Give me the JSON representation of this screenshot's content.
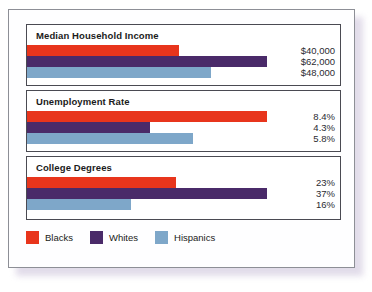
{
  "chart_data": {
    "type": "bar",
    "orientation": "horizontal",
    "title": "",
    "xlabel": "",
    "ylabel": "",
    "grid": false,
    "legend_position": "bottom-left",
    "categories": [
      "Median Household Income",
      "Unemployment Rate",
      "College Degrees"
    ],
    "series": [
      {
        "name": "Blacks",
        "color": "#e8351c",
        "values": [
          40000,
          8.4,
          23
        ]
      },
      {
        "name": "Whites",
        "color": "#4a2a69",
        "values": [
          62000,
          4.3,
          37
        ]
      },
      {
        "name": "Hispanics",
        "color": "#7ea7c9",
        "values": [
          48000,
          5.8,
          16
        ]
      }
    ],
    "groups": [
      {
        "title": "Median Household Income",
        "bars": [
          {
            "series": "Blacks",
            "value": 40000,
            "label": "$40,000",
            "bar_pct": 63.5
          },
          {
            "series": "Whites",
            "value": 62000,
            "label": "$62,000",
            "bar_pct": 100.0
          },
          {
            "series": "Hispanics",
            "value": 48000,
            "label": "$48,000",
            "bar_pct": 76.5
          }
        ]
      },
      {
        "title": "Unemployment Rate",
        "bars": [
          {
            "series": "Blacks",
            "value": 8.4,
            "label": "8.4%",
            "bar_pct": 100.0
          },
          {
            "series": "Whites",
            "value": 4.3,
            "label": "4.3%",
            "bar_pct": 51.2
          },
          {
            "series": "Hispanics",
            "value": 5.8,
            "label": "5.8%",
            "bar_pct": 69.0
          }
        ]
      },
      {
        "title": "College Degrees",
        "bars": [
          {
            "series": "Blacks",
            "value": 23,
            "label": "23%",
            "bar_pct": 62.2
          },
          {
            "series": "Whites",
            "value": 37,
            "label": "37%",
            "bar_pct": 100.0
          },
          {
            "series": "Hispanics",
            "value": 16,
            "label": "16%",
            "bar_pct": 43.2
          }
        ]
      }
    ],
    "legend": [
      {
        "label": "Blacks",
        "color": "#e8351c"
      },
      {
        "label": "Whites",
        "color": "#4a2a69"
      },
      {
        "label": "Hispanics",
        "color": "#7ea7c9"
      }
    ]
  }
}
